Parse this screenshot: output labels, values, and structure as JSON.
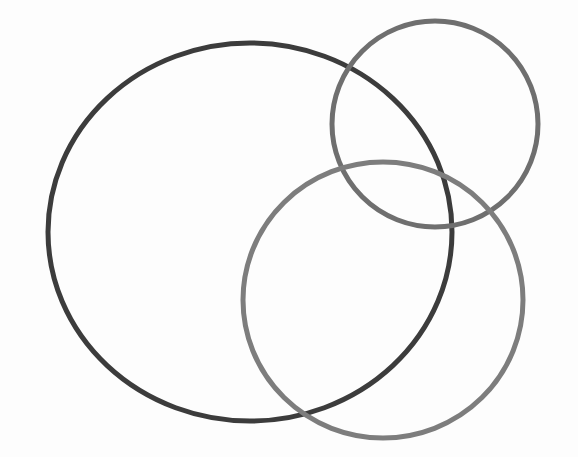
{
  "canvas": {
    "width": 578,
    "height": 457,
    "background_color": "#fdfdfd",
    "title": "Three Overlapping Circles"
  },
  "shapes": [
    {
      "name": "large-dark-circle",
      "role": "left-large-ring",
      "shape": "ellipse",
      "cx": 250,
      "cy": 232,
      "rx": 202,
      "ry": 189,
      "stroke_color": "#3c3c3c",
      "stroke_width": 5,
      "fill": "none",
      "bounds": {
        "left": 48,
        "right": 452,
        "top": 43,
        "bottom": 421
      }
    },
    {
      "name": "medium-gray-circle",
      "role": "top-right-ring",
      "shape": "ellipse",
      "cx": 435,
      "cy": 124,
      "rx": 103,
      "ry": 103,
      "stroke_color": "#6f6f6f",
      "stroke_width": 5,
      "fill": "none",
      "bounds": {
        "left": 332,
        "right": 538,
        "top": 21,
        "bottom": 227
      }
    },
    {
      "name": "light-gray-circle",
      "role": "bottom-right-ring",
      "shape": "ellipse",
      "cx": 383,
      "cy": 300,
      "rx": 140,
      "ry": 138,
      "stroke_color": "#7d7d7d",
      "stroke_width": 5,
      "fill": "none",
      "bounds": {
        "left": 243,
        "right": 523,
        "top": 162,
        "bottom": 438
      }
    }
  ]
}
